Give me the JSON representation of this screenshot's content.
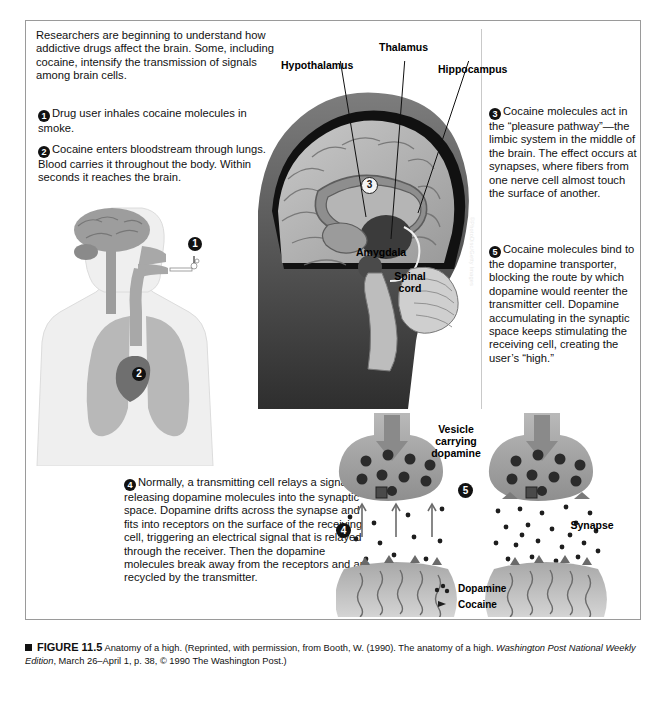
{
  "intro": {
    "text": "Researchers are beginning to understand how addictive drugs affect the brain. Some, including cocaine, intensify the transmission of signals among brain cells."
  },
  "steps": [
    {
      "number": "1",
      "text": "Drug user inhales cocaine molecules in smoke."
    },
    {
      "number": "2",
      "text": "Cocaine enters bloodstream through lungs. Blood carries it throughout the body. Within seconds it reaches the brain."
    },
    {
      "number": "3",
      "text": "Cocaine molecules act in the “pleasure pathway”—the limbic system in the middle of the brain. The effect occurs at synapses, where fibers from one nerve cell almost touch the surface of another."
    },
    {
      "number": "4",
      "text": "Normally, a transmitting cell relays a signal by releasing dopamine molecules into the synaptic space. Dopamine drifts across the synapse and fits into receptors on the surface of the receiving cell, triggering an electrical signal that is relayed through the receiver. Then the dopamine molecules break away from the receptors and are recycled by the transmitter."
    },
    {
      "number": "5",
      "text": "Cocaine molecules bind to the dopamine transporter, blocking the route by which dopamine would reenter the transmitter cell. Dopamine accumulating in the synaptic space keeps stimulating the receiving cell, creating the user’s “high.”"
    }
  ],
  "brain_labels": {
    "hypothalamus": "Hypothalamus",
    "thalamus": "Thalamus",
    "hippocampus": "Hippocampus",
    "amygdala": "Amygdala",
    "spinal_cord": "Spinal cord",
    "marker_3": "3"
  },
  "body_markers": {
    "marker_1": "1",
    "marker_2": "2"
  },
  "photo_credit": "©PhotoDisc/Getty Images",
  "synapse": {
    "vesicle_label": "Vesicle carrying dopamine",
    "synapse_label": "Synapse",
    "marker_4": "4",
    "marker_5": "5"
  },
  "legend": {
    "dopamine": "Dopamine",
    "cocaine": "Cocaine"
  },
  "caption": {
    "figure_number": "FIGURE 11.5",
    "title": "Anatomy of a high.",
    "source_part1": "(Reprinted, with permission, from Booth, W. (1990). The anatomy of a high. ",
    "source_italic1": "Washington Post National Weekly Edition",
    "source_part2": ", March 26–April 1, p. 38, © 1990 The Washington Post.)"
  },
  "colors": {
    "frame": "#9a9a9a",
    "marker": "#111111",
    "body_fill": "#efefef",
    "lung_fill": "#b8b8b8",
    "heart_fill": "#7a7a7a",
    "neuron_fill": "#a9a9a9"
  }
}
